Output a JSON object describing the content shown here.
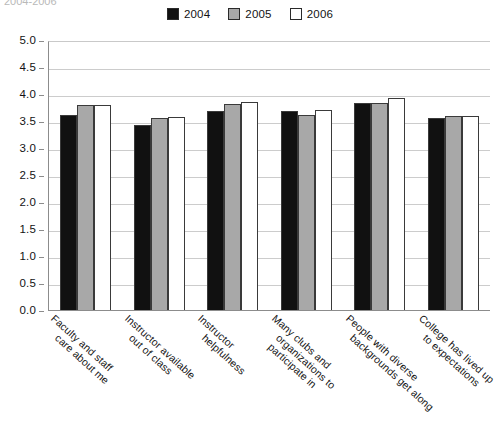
{
  "top_caption_fragment": "2004-2006",
  "legend": {
    "position": "top-center",
    "entries": [
      {
        "label": "2004",
        "color": "#111111",
        "swatch": "legend-swatch-2004"
      },
      {
        "label": "2005",
        "color": "#a8a8a8",
        "swatch": "legend-swatch-2005"
      },
      {
        "label": "2006",
        "color": "#ffffff",
        "swatch": "legend-swatch-2006"
      }
    ]
  },
  "y_axis": {
    "ticks": [
      "5.0",
      "4.5",
      "4.0",
      "3.5",
      "3.0",
      "2.5",
      "2.0",
      "1.5",
      "1.0",
      "0.5",
      "0.0"
    ]
  },
  "x_axis": {
    "categories": [
      {
        "line1": "Faculty and staff",
        "line2": "care about me"
      },
      {
        "line1": "Instructor available",
        "line2": "out of class"
      },
      {
        "line1": "Instructor",
        "line2": "helpfulness"
      },
      {
        "line1": "Many clubs and",
        "line2": "organizations to",
        "line3": "participate in"
      },
      {
        "line1": "People with diverse",
        "line2": "backgrounds get along"
      },
      {
        "line1": "College has lived up",
        "line2": "to expectations"
      }
    ]
  },
  "chart_data": {
    "type": "bar",
    "title": "",
    "subtitle": "",
    "xlabel": "",
    "ylabel": "",
    "ylim": [
      0.0,
      5.0
    ],
    "ytick_step": 0.5,
    "grid": true,
    "legend_position": "top-center",
    "categories": [
      "Faculty and staff care about me",
      "Instructor available out of class",
      "Instructor helpfulness",
      "Many clubs and organizations to participate in",
      "People with diverse backgrounds get along",
      "College has lived up to expectations"
    ],
    "series": [
      {
        "name": "2004",
        "color": "#111111",
        "values": [
          3.62,
          3.42,
          3.68,
          3.68,
          3.83,
          3.55
        ]
      },
      {
        "name": "2005",
        "color": "#a8a8a8",
        "values": [
          3.79,
          3.55,
          3.82,
          3.62,
          3.83,
          3.59
        ]
      },
      {
        "name": "2006",
        "color": "#ffffff",
        "values": [
          3.79,
          3.58,
          3.85,
          3.7,
          3.93,
          3.59
        ]
      }
    ]
  }
}
